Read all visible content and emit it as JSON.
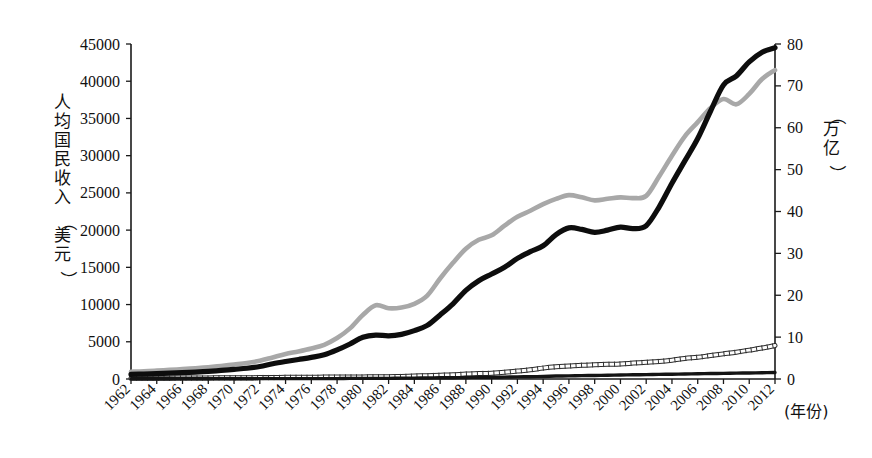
{
  "chart_data": {
    "type": "line",
    "title": "",
    "xlabel": "(年份)",
    "ylabel": "人均国民收入（美元）",
    "y2label": "（万亿）",
    "xlim": [
      1962,
      2012
    ],
    "ylim": [
      0,
      45000
    ],
    "y2lim": [
      0,
      80
    ],
    "grid": false,
    "legend": "none",
    "x": [
      1962,
      1963,
      1964,
      1965,
      1966,
      1967,
      1968,
      1969,
      1970,
      1971,
      1972,
      1973,
      1974,
      1975,
      1976,
      1977,
      1978,
      1979,
      1980,
      1981,
      1982,
      1983,
      1984,
      1985,
      1986,
      1987,
      1988,
      1989,
      1990,
      1991,
      1992,
      1993,
      1994,
      1995,
      1996,
      1997,
      1998,
      1999,
      2000,
      2001,
      2002,
      2003,
      2004,
      2005,
      2006,
      2007,
      2008,
      2009,
      2010,
      2011,
      2012
    ],
    "x_tick_labels": [
      "1962",
      "1964",
      "1966",
      "1968",
      "1970",
      "1972",
      "1974",
      "1976",
      "1978",
      "1980",
      "1982",
      "1984",
      "1986",
      "1988",
      "1990",
      "1992",
      "1994",
      "1996",
      "1998",
      "2000",
      "2002",
      "2004",
      "2006",
      "2008",
      "2010",
      "2012"
    ],
    "y_tick_labels": [
      "0",
      "5000",
      "10000",
      "15000",
      "20000",
      "25000",
      "30000",
      "35000",
      "40000",
      "45000"
    ],
    "y2_tick_labels": [
      "0",
      "10",
      "20",
      "30",
      "40",
      "50",
      "60",
      "70",
      "80"
    ],
    "series": [
      {
        "name": "人均国民收入-黑粗线",
        "axis": "left",
        "style": "thick-black-line",
        "color": "#0d0d0d",
        "values": [
          620,
          660,
          720,
          790,
          860,
          930,
          1030,
          1150,
          1300,
          1450,
          1680,
          2050,
          2350,
          2620,
          2900,
          3250,
          3900,
          4700,
          5600,
          5900,
          5800,
          6000,
          6500,
          7200,
          8600,
          10100,
          11900,
          13200,
          14100,
          15000,
          16200,
          17100,
          17900,
          19400,
          20300,
          20100,
          19700,
          20000,
          20400,
          20200,
          20600,
          23100,
          26300,
          29300,
          32300,
          36000,
          39500,
          40700,
          42600,
          43900,
          44500
        ]
      },
      {
        "name": "人均国民收入-灰粗线",
        "axis": "left",
        "style": "thick-gray-line",
        "color": "#a8a8a8",
        "values": [
          980,
          1030,
          1120,
          1220,
          1320,
          1440,
          1580,
          1750,
          1950,
          2150,
          2450,
          2900,
          3350,
          3700,
          4100,
          4600,
          5500,
          6800,
          8600,
          9900,
          9500,
          9600,
          10100,
          11200,
          13500,
          15600,
          17500,
          18700,
          19300,
          20600,
          21800,
          22600,
          23500,
          24200,
          24700,
          24400,
          24000,
          24200,
          24400,
          24300,
          24600,
          27200,
          30000,
          32600,
          34500,
          36400,
          37600,
          36900,
          38300,
          40300,
          41500
        ]
      },
      {
        "name": "国民总收入-白色方格线",
        "axis": "right",
        "style": "hatched-white-line",
        "color": "#ffffff",
        "values": [
          0.2,
          0.2,
          0.2,
          0.2,
          0.25,
          0.25,
          0.25,
          0.3,
          0.3,
          0.3,
          0.35,
          0.35,
          0.4,
          0.4,
          0.4,
          0.45,
          0.45,
          0.5,
          0.5,
          0.55,
          0.55,
          0.6,
          0.7,
          0.8,
          0.9,
          1.0,
          1.2,
          1.3,
          1.4,
          1.6,
          1.9,
          2.2,
          2.6,
          2.9,
          3.1,
          3.3,
          3.4,
          3.5,
          3.6,
          3.8,
          4.0,
          4.2,
          4.5,
          4.9,
          5.2,
          5.6,
          6.0,
          6.4,
          6.9,
          7.4,
          8.0
        ]
      },
      {
        "name": "国民总收入-黑细线",
        "axis": "right",
        "style": "thin-black-line",
        "color": "#141414",
        "values": [
          0.05,
          0.05,
          0.05,
          0.05,
          0.05,
          0.05,
          0.05,
          0.05,
          0.05,
          0.05,
          0.1,
          0.1,
          0.1,
          0.1,
          0.1,
          0.1,
          0.1,
          0.15,
          0.15,
          0.15,
          0.15,
          0.2,
          0.2,
          0.25,
          0.3,
          0.3,
          0.35,
          0.4,
          0.4,
          0.45,
          0.5,
          0.55,
          0.6,
          0.7,
          0.75,
          0.8,
          0.85,
          0.9,
          0.95,
          1.0,
          1.05,
          1.1,
          1.15,
          1.2,
          1.25,
          1.3,
          1.35,
          1.4,
          1.45,
          1.5,
          1.55
        ]
      }
    ]
  }
}
